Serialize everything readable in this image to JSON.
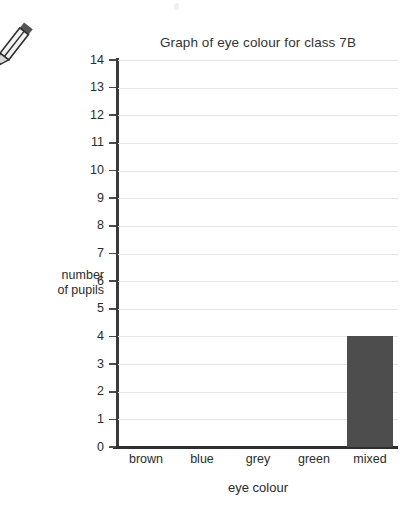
{
  "decorations": {
    "pencil_icon": "pencil-icon"
  },
  "chart_data": {
    "type": "bar",
    "title": "Graph of eye colour for class 7B",
    "xlabel": "eye colour",
    "ylabel": "number\nof pupils",
    "ylabel_lines": [
      "number",
      "of pupils"
    ],
    "categories": [
      "brown",
      "blue",
      "grey",
      "green",
      "mixed"
    ],
    "values": [
      0,
      0,
      0,
      0,
      4
    ],
    "ylim": [
      0,
      14
    ],
    "ytick_step": 1,
    "yticks": [
      14,
      13,
      12,
      11,
      10,
      9,
      8,
      7,
      6,
      5,
      4,
      3,
      2,
      1,
      0
    ],
    "grid": true,
    "grid_axis": "y",
    "legend": false,
    "bar_color": "#4d4d4d",
    "grid_color": "#e6e6e6",
    "axis_color": "#2e2e2e",
    "text_color": "#2b2b2b"
  }
}
